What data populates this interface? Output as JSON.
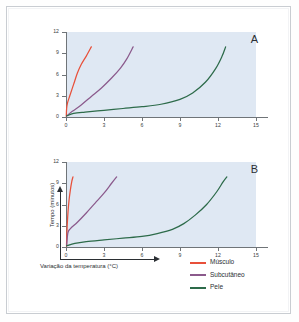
{
  "figure": {
    "background_color": "#ffffff",
    "frame_color": "#c9cdd2",
    "plot_background_color": "#dfe8f3"
  },
  "axis_labels": {
    "y": "Tempo (minutos)",
    "x": "Variação da temperatura (°C)"
  },
  "panels": [
    {
      "letter": "A"
    },
    {
      "letter": "B"
    }
  ],
  "legend": {
    "items": [
      {
        "label": "Músculo",
        "color": "#e8503a"
      },
      {
        "label": "Subcutâneo",
        "color": "#8b5a8c"
      },
      {
        "label": "Pele",
        "color": "#2d6b4a"
      }
    ]
  },
  "ticks": {
    "y": [
      "0",
      "3",
      "6",
      "9",
      "12"
    ],
    "x": [
      "0",
      "3",
      "6",
      "9",
      "12",
      "15"
    ]
  },
  "chart_data": [
    {
      "type": "line",
      "title": "A",
      "xlabel": "Variação da temperatura (°C)",
      "ylabel": "Tempo (minutos)",
      "xlim": [
        0,
        15
      ],
      "ylim": [
        0,
        12
      ],
      "xticks": [
        0,
        3,
        6,
        9,
        12,
        15
      ],
      "yticks": [
        0,
        3,
        6,
        9,
        12
      ],
      "grid": false,
      "legend_position": "below-right",
      "series": [
        {
          "name": "Músculo",
          "color": "#e8503a",
          "points": [
            [
              0.02,
              0.1
            ],
            [
              0.05,
              1.2
            ],
            [
              0.12,
              2.0
            ],
            [
              0.3,
              3.0
            ],
            [
              0.6,
              4.6
            ],
            [
              0.9,
              6.2
            ],
            [
              1.2,
              7.4
            ],
            [
              1.6,
              8.6
            ],
            [
              2.0,
              9.9
            ]
          ]
        },
        {
          "name": "Subcutâneo",
          "color": "#8b5a8c",
          "points": [
            [
              0.05,
              0.15
            ],
            [
              0.5,
              0.8
            ],
            [
              1.2,
              1.7
            ],
            [
              2.0,
              2.9
            ],
            [
              2.8,
              4.1
            ],
            [
              3.6,
              5.5
            ],
            [
              4.3,
              6.9
            ],
            [
              4.8,
              8.2
            ],
            [
              5.3,
              9.9
            ]
          ]
        },
        {
          "name": "Pele",
          "color": "#2d6b4a",
          "points": [
            [
              0.05,
              0.15
            ],
            [
              0.6,
              0.5
            ],
            [
              1.5,
              0.7
            ],
            [
              3.0,
              0.95
            ],
            [
              4.5,
              1.2
            ],
            [
              6.0,
              1.45
            ],
            [
              7.5,
              1.8
            ],
            [
              9.0,
              2.5
            ],
            [
              10.0,
              3.4
            ],
            [
              11.0,
              4.9
            ],
            [
              11.8,
              6.8
            ],
            [
              12.3,
              8.5
            ],
            [
              12.6,
              9.9
            ]
          ]
        }
      ]
    },
    {
      "type": "line",
      "title": "B",
      "xlabel": "Variação da temperatura (°C)",
      "ylabel": "Tempo (minutos)",
      "xlim": [
        0,
        15
      ],
      "ylim": [
        0,
        12
      ],
      "xticks": [
        0,
        3,
        6,
        9,
        12,
        15
      ],
      "yticks": [
        0,
        3,
        6,
        9,
        12
      ],
      "grid": false,
      "legend_position": "below-right",
      "series": [
        {
          "name": "Músculo",
          "color": "#e8503a",
          "points": [
            [
              0.04,
              0.1
            ],
            [
              0.06,
              1.5
            ],
            [
              0.1,
              3.2
            ],
            [
              0.16,
              5.0
            ],
            [
              0.24,
              6.6
            ],
            [
              0.34,
              8.0
            ],
            [
              0.45,
              9.2
            ],
            [
              0.55,
              9.9
            ]
          ]
        },
        {
          "name": "Subcutâneo",
          "color": "#8b5a8c",
          "points": [
            [
              0.05,
              0.2
            ],
            [
              0.15,
              2.0
            ],
            [
              0.35,
              2.6
            ],
            [
              0.9,
              3.5
            ],
            [
              1.6,
              4.8
            ],
            [
              2.3,
              6.2
            ],
            [
              3.0,
              7.6
            ],
            [
              3.6,
              9.0
            ],
            [
              4.0,
              9.9
            ]
          ]
        },
        {
          "name": "Pele",
          "color": "#2d6b4a",
          "points": [
            [
              0.05,
              0.15
            ],
            [
              0.7,
              0.5
            ],
            [
              1.6,
              0.75
            ],
            [
              3.0,
              1.0
            ],
            [
              4.5,
              1.25
            ],
            [
              6.0,
              1.5
            ],
            [
              7.2,
              1.9
            ],
            [
              8.4,
              2.5
            ],
            [
              9.3,
              3.3
            ],
            [
              10.2,
              4.5
            ],
            [
              11.1,
              6.0
            ],
            [
              11.9,
              7.8
            ],
            [
              12.4,
              9.2
            ],
            [
              12.7,
              9.9
            ]
          ]
        }
      ]
    }
  ]
}
